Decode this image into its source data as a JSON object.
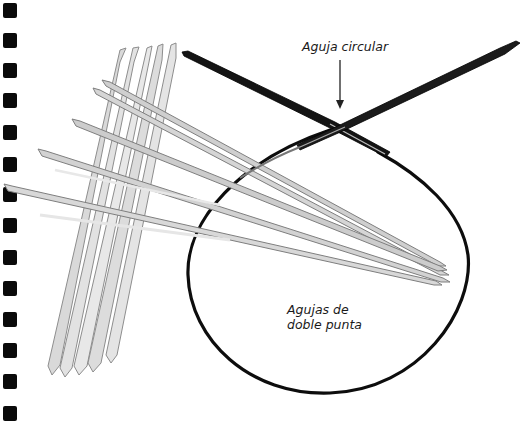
{
  "page": {
    "background": "#ffffff",
    "binding": {
      "hole_count": 14,
      "hole_color": "#0a0a0a",
      "hole_positions_y": [
        3,
        33,
        63,
        93,
        125,
        157,
        187,
        218,
        250,
        281,
        312,
        343,
        374,
        406
      ]
    }
  },
  "illustration": {
    "subject": "knitting needles",
    "items": [
      {
        "id": "circular-needle",
        "description": "circular needle with dark metal tips and black cable loop",
        "color": "#111111"
      },
      {
        "id": "double-pointed-needles-vertical",
        "count": 5,
        "color": "#d8d8d8"
      },
      {
        "id": "double-pointed-needles-horizontal",
        "count": 5,
        "color": "#bdbdbd"
      }
    ]
  },
  "labels": {
    "circular": "Aguja circular",
    "dpn_line1": "Agujas de",
    "dpn_line2": "doble punta"
  },
  "annotations": {
    "arrow": {
      "from": [
        340,
        60
      ],
      "to": [
        340,
        108
      ],
      "points_to": "circular-needle"
    }
  }
}
